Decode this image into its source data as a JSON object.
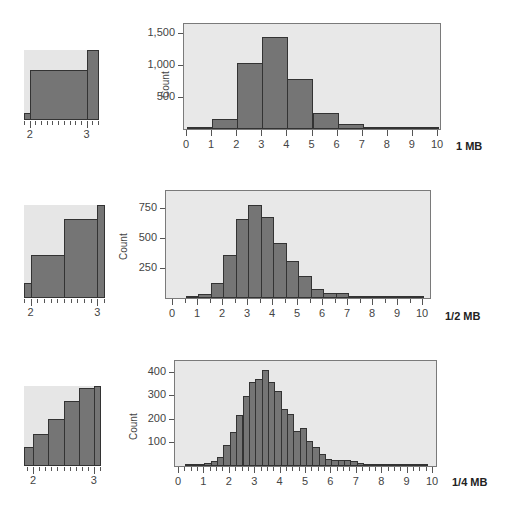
{
  "chart_data": [
    {
      "type": "bar",
      "label": "1 MB",
      "title": "",
      "xlabel": "",
      "ylabel": "Count",
      "bin_width": 1,
      "x_ticks": [
        0,
        1,
        2,
        3,
        4,
        5,
        6,
        7,
        8,
        9,
        10
      ],
      "y_ticks": [
        "500",
        "1,000",
        "1,500"
      ],
      "ylim": [
        0,
        1650
      ],
      "xlim": [
        0,
        10
      ],
      "bins_start": [
        0,
        1,
        2,
        3,
        4,
        5,
        6,
        7,
        8,
        9
      ],
      "values": [
        10,
        150,
        1020,
        1440,
        780,
        250,
        80,
        30,
        20,
        5
      ],
      "inset": {
        "x_ticks": [
          "2",
          "3"
        ],
        "range": [
          1.9,
          3.2
        ],
        "description": "zoom of bins near 2-3"
      }
    },
    {
      "type": "bar",
      "label": "1/2 MB",
      "ylabel": "Count",
      "bin_width": 0.5,
      "x_ticks": [
        0,
        1,
        2,
        3,
        4,
        5,
        6,
        7,
        8,
        9,
        10
      ],
      "y_ticks": [
        "250",
        "500",
        "750"
      ],
      "ylim": [
        0,
        900
      ],
      "xlim": [
        0,
        10
      ],
      "bins_start": [
        0.5,
        1,
        1.5,
        2,
        2.5,
        3,
        3.5,
        4,
        4.5,
        5,
        5.5,
        6,
        6.5,
        7,
        7.5,
        8,
        8.5,
        9,
        9.5
      ],
      "values": [
        10,
        35,
        125,
        360,
        655,
        775,
        675,
        455,
        305,
        180,
        75,
        45,
        45,
        20,
        15,
        15,
        15,
        10,
        10
      ],
      "inset": {
        "x_ticks": [
          "2",
          "3"
        ],
        "range": [
          1.9,
          3.1
        ]
      }
    },
    {
      "type": "bar",
      "label": "1/4 MB",
      "ylabel": "Count",
      "bin_width": 0.25,
      "x_ticks": [
        0,
        1,
        2,
        3,
        4,
        5,
        6,
        7,
        8,
        9,
        10
      ],
      "y_ticks": [
        "100",
        "200",
        "300",
        "400"
      ],
      "ylim": [
        0,
        450
      ],
      "xlim": [
        0,
        10
      ],
      "bins_start": [
        0.25,
        0.5,
        0.75,
        1,
        1.25,
        1.5,
        1.75,
        2,
        2.25,
        2.5,
        2.75,
        3,
        3.25,
        3.5,
        3.75,
        4,
        4.25,
        4.5,
        4.75,
        5,
        5.25,
        5.5,
        5.75,
        6,
        6.25,
        6.5,
        6.75,
        7,
        7.25,
        7.5,
        7.75,
        8,
        8.25,
        8.5,
        8.75,
        9,
        9.25,
        9.5
      ],
      "values": [
        3,
        7,
        9,
        12,
        22,
        40,
        88,
        145,
        218,
        298,
        358,
        368,
        408,
        358,
        320,
        242,
        222,
        148,
        160,
        108,
        82,
        50,
        28,
        26,
        24,
        24,
        20,
        12,
        10,
        10,
        8,
        8,
        6,
        6,
        5,
        4,
        2,
        5
      ],
      "inset": {
        "x_ticks": [
          "2",
          "3"
        ],
        "range": [
          1.85,
          3.1
        ]
      }
    }
  ],
  "labels": {
    "count": "Count",
    "panel1": "1 MB",
    "panel2": "1/2 MB",
    "panel3": "1/4 MB"
  },
  "colors": {
    "bar": "#757575",
    "frame_bg": "#e8e8e8",
    "border": "#333333"
  }
}
